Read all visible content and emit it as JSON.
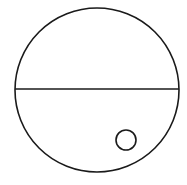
{
  "diagram": {
    "stroke_color": "#1a1a1a",
    "background": "#ffffff",
    "outer_circle": {
      "cx": 97,
      "cy": 90,
      "r": 82
    },
    "divider_line": {
      "x1": 15,
      "y1": 89,
      "x2": 179,
      "y2": 89
    },
    "inner_circle": {
      "cx": 126,
      "cy": 140,
      "r": 10
    }
  }
}
